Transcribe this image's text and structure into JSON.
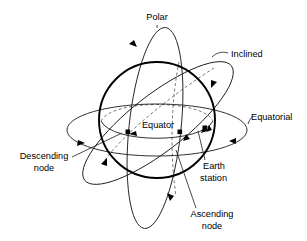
{
  "figure": {
    "background_color": "#ffffff",
    "line_color": "#1a1a1a",
    "earth_outline_color": "#000000",
    "hidden_line_color": "#555555"
  },
  "labels": {
    "polar": "Polar",
    "inclined": "Inclined",
    "equatorial": "Equatorial",
    "equator": "Equator",
    "descending_node_line1": "Descending",
    "descending_node_line2": "node",
    "ascending_node_line1": "Ascending",
    "ascending_node_line2": "node",
    "earth_station_line1": "Earth",
    "earth_station_line2": "station"
  },
  "elements": {
    "earth": {
      "name": "earth-sphere",
      "cx": 157,
      "cy": 120,
      "r": 58
    },
    "orbits": [
      {
        "name": "polar-orbit",
        "label": "Polar",
        "type": "polar"
      },
      {
        "name": "inclined-orbit",
        "label": "Inclined",
        "type": "inclined"
      },
      {
        "name": "equatorial-orbit",
        "label": "Equatorial",
        "type": "equatorial"
      }
    ],
    "markers": [
      {
        "name": "descending-node-marker",
        "x": 128,
        "y": 132
      },
      {
        "name": "ascending-node-marker",
        "x": 180,
        "y": 132
      },
      {
        "name": "earth-station-marker",
        "x": 205,
        "y": 128
      }
    ]
  }
}
